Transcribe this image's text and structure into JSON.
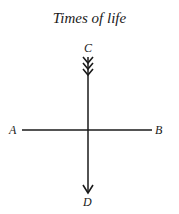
{
  "title": "Times of life",
  "labels": {
    "top": "C",
    "bottom": "D",
    "left": "A",
    "right": "B"
  },
  "colors": {
    "ink": "#1a1a1a",
    "background": "#ffffff"
  }
}
